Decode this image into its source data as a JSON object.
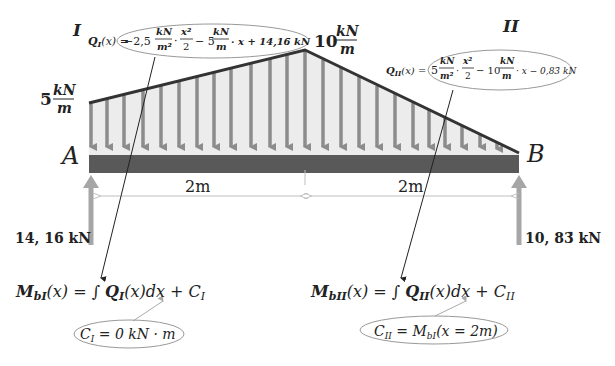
{
  "colors": {
    "beam": "#595959",
    "load_fill": "#ececec",
    "load_arrow": "#8c8c8c",
    "load_outline": "#333333",
    "reaction_arrow": "#a6a6a6",
    "dimension_line": "#bfbfbf",
    "ellipse_stroke": "#999999",
    "leader_line": "#222222"
  },
  "segments": {
    "left_label": "I",
    "right_label": "II"
  },
  "supports": {
    "left": "A",
    "right": "B"
  },
  "loads": {
    "left_intensity_value": "5",
    "right_peak_value": "10",
    "unit_num": "kN",
    "unit_den": "m"
  },
  "dimensions": {
    "left_span": "2m",
    "right_span": "2m"
  },
  "reactions": {
    "A": "14, 16̄ kN",
    "B": "10, 83̄ kN"
  },
  "equations": {
    "Q_I": {
      "lhs": "Q",
      "lhs_sub": "I",
      "lhs_arg": "(x) =",
      "coef1": "−2,5",
      "frac1_num": "kN",
      "frac1_den": "m²",
      "frac2_num": "x²",
      "frac2_den": "2",
      "mid": "− 5",
      "frac3_num": "kN",
      "frac3_den": "m",
      "tail": "· x + 14,16̄ kN"
    },
    "Q_II": {
      "lhs": "Q",
      "lhs_sub": "II",
      "lhs_arg": "(x) =",
      "coef1": "5",
      "frac1_num": "kN",
      "frac1_den": "m²",
      "frac2_num": "x²",
      "frac2_den": "2",
      "mid": "− 10",
      "frac3_num": "kN",
      "frac3_den": "m",
      "tail": "· x − 0,83̄ kN"
    },
    "M_bI": {
      "lhs": "M",
      "lhs_sub": "bI",
      "rhs": "(x) = ∫ ",
      "q": "Q",
      "q_sub": "I",
      "tail": "(x)dx + C",
      "tail_sub": "I"
    },
    "M_bII": {
      "lhs": "M",
      "lhs_sub": "bII",
      "rhs": "(x) = ∫ ",
      "q": "Q",
      "q_sub": "II",
      "tail": "(x)dx + C",
      "tail_sub": "II"
    },
    "C_I": {
      "c": "C",
      "c_sub": "I",
      "rhs": " = 0 kN · m"
    },
    "C_II": {
      "c": "C",
      "c_sub": "II",
      "rhs": " = M",
      "rhs_sub": "bI",
      "tail": "(x = 2m)"
    }
  }
}
